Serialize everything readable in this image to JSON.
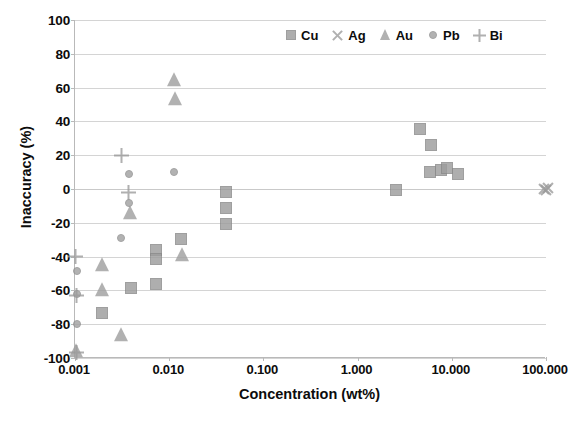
{
  "chart_data": {
    "type": "scatter",
    "title": "",
    "xlabel": "Concentration (wt%)",
    "ylabel": "Inaccuracy (%)",
    "xscale": "log",
    "xlim": [
      0.001,
      100.0
    ],
    "ylim": [
      -100,
      100
    ],
    "ytick_labels": [
      "100",
      "80",
      "60",
      "40",
      "20",
      "0",
      "-20",
      "-40",
      "-60",
      "-80",
      "-100"
    ],
    "ytick_values": [
      100,
      80,
      60,
      40,
      20,
      0,
      -20,
      -40,
      -60,
      -80,
      -100
    ],
    "xtick_labels": [
      "0.001",
      "0.010",
      "0.100",
      "1.000",
      "10.000",
      "100.000"
    ],
    "xtick_values": [
      0.001,
      0.01,
      0.1,
      1.0,
      10.0,
      100.0
    ],
    "grid": "horizontal",
    "legend_position": "top-right",
    "marker_color": "#9d9d9d",
    "gridline_color": "#d4d4d4",
    "axis_color": "#b9b9b9",
    "series": [
      {
        "name": "Cu",
        "marker": "square",
        "points": [
          [
            0.00195,
            -73.5
          ],
          [
            0.0039,
            -58.5
          ],
          [
            0.0073,
            -56.5
          ],
          [
            0.0073,
            -36.0
          ],
          [
            0.0073,
            -41.5
          ],
          [
            0.0135,
            -29.5
          ],
          [
            0.04,
            -2.0
          ],
          [
            0.04,
            -11.0
          ],
          [
            0.04,
            -21.0
          ],
          [
            2.55,
            -0.5
          ],
          [
            4.6,
            35.5
          ],
          [
            6.0,
            26.0
          ],
          [
            5.9,
            10.0
          ],
          [
            7.6,
            11.0
          ],
          [
            9.0,
            12.5
          ],
          [
            11.5,
            9.0
          ]
        ]
      },
      {
        "name": "Ag",
        "marker": "x",
        "points": [
          [
            95.0,
            0.0
          ],
          [
            100.0,
            -0.5
          ],
          [
            105.0,
            0.5
          ]
        ]
      },
      {
        "name": "Au",
        "marker": "triangle",
        "points": [
          [
            0.00102,
            -96.0
          ],
          [
            0.00195,
            -45.0
          ],
          [
            0.00195,
            -59.5
          ],
          [
            0.0031,
            -86.5
          ],
          [
            0.0038,
            -14.0
          ],
          [
            0.0112,
            64.5
          ],
          [
            0.0115,
            53.5
          ],
          [
            0.0138,
            -39.0
          ]
        ]
      },
      {
        "name": "Pb",
        "marker": "circle",
        "points": [
          [
            0.00105,
            -48.5
          ],
          [
            0.00105,
            -62.0
          ],
          [
            0.00105,
            -80.0
          ],
          [
            0.0031,
            -29.0
          ],
          [
            0.0037,
            9.0
          ],
          [
            0.0037,
            -8.0
          ],
          [
            0.0112,
            10.0
          ]
        ]
      },
      {
        "name": "Bi",
        "marker": "plus",
        "points": [
          [
            0.001,
            -40.0
          ],
          [
            0.00105,
            -63.0
          ],
          [
            0.00105,
            -96.5
          ],
          [
            0.0031,
            20.0
          ],
          [
            0.0037,
            -2.0
          ]
        ]
      }
    ]
  },
  "legend": {
    "items": [
      {
        "label": "Cu",
        "glyph": "square-marker-icon"
      },
      {
        "label": "Ag",
        "glyph": "x-marker-icon"
      },
      {
        "label": "Au",
        "glyph": "triangle-marker-icon"
      },
      {
        "label": "Pb",
        "glyph": "circle-marker-icon"
      },
      {
        "label": "Bi",
        "glyph": "plus-marker-icon"
      }
    ]
  }
}
